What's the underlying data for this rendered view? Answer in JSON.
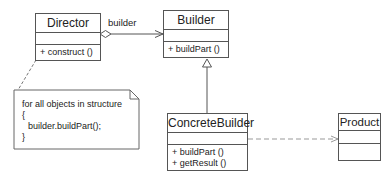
{
  "diagram": {
    "type": "UML class diagram",
    "pattern": "Builder",
    "classes": {
      "director": {
        "name": "Director",
        "operations": [
          "+  construct ()"
        ]
      },
      "builder": {
        "name": "Builder",
        "operations": [
          "+  buildPart ()"
        ]
      },
      "concrete_builder": {
        "name": "ConcreteBuilder",
        "operations": [
          "+  buildPart ()",
          "+  getResult ()"
        ]
      },
      "product": {
        "name": "Product",
        "operations": []
      }
    },
    "relationships": [
      {
        "from": "Director",
        "to": "Builder",
        "kind": "aggregation",
        "label": "builder"
      },
      {
        "from": "ConcreteBuilder",
        "to": "Builder",
        "kind": "generalization"
      },
      {
        "from": "ConcreteBuilder",
        "to": "Product",
        "kind": "dependency"
      },
      {
        "from": "note",
        "to": "Director",
        "kind": "note-anchor"
      }
    ],
    "note": {
      "lines": [
        "for all objects in structure",
        "{",
        "  builder.buildPart();",
        "}"
      ]
    },
    "colors": {
      "line": "#555555",
      "dashed": "#999999",
      "background": "#ffffff"
    }
  }
}
